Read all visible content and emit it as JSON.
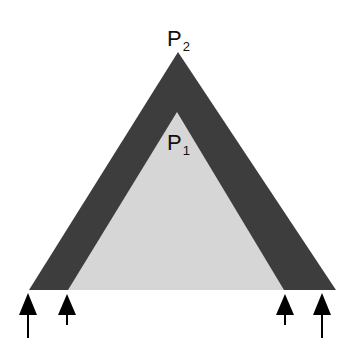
{
  "diagram": {
    "type": "nested-triangles-with-arrows",
    "colors": {
      "background": "#ffffff",
      "outer_triangle": "#3d3d3d",
      "inner_triangle": "#d6d6d6",
      "arrows": "#000000",
      "text": "#111111"
    },
    "labels": {
      "outer_apex": {
        "main": "P",
        "sub": "2"
      },
      "inner_apex": {
        "main": "P",
        "sub": "1"
      }
    },
    "arrows": [
      {
        "id": "outer-left",
        "length": "long"
      },
      {
        "id": "inner-left",
        "length": "short"
      },
      {
        "id": "inner-right",
        "length": "short"
      },
      {
        "id": "outer-right",
        "length": "long"
      }
    ]
  }
}
